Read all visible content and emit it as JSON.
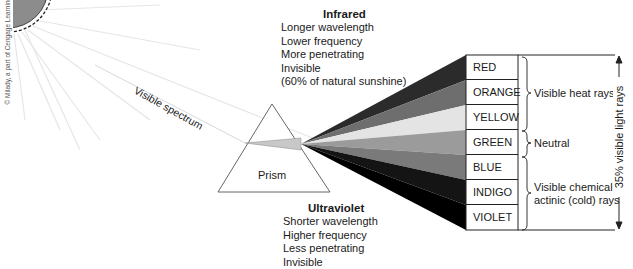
{
  "copyright": "© Milady, a part of Cengage Learning",
  "labels": {
    "visible_spectrum": "Visible spectrum",
    "prism": "Prism"
  },
  "infrared": {
    "title": "Infrared",
    "lines": [
      "Longer wavelength",
      "Lower frequency",
      "More penetrating",
      "Invisible",
      "(60% of natural sunshine)"
    ]
  },
  "ultraviolet": {
    "title": "Ultraviolet",
    "lines": [
      "Shorter wavelength",
      "Higher frequency",
      "Less penetrating",
      "Invisible"
    ]
  },
  "spectrum": {
    "colors": [
      {
        "label": "RED",
        "shade": "#2b2b2b"
      },
      {
        "label": "ORANGE",
        "shade": "#6e6e6e"
      },
      {
        "label": "YELLOW",
        "shade": "#e4e4e4"
      },
      {
        "label": "GREEN",
        "shade": "#9b9b9b"
      },
      {
        "label": "BLUE",
        "shade": "#7a7a7a"
      },
      {
        "label": "INDIGO",
        "shade": "#141414"
      },
      {
        "label": "VIOLET",
        "shade": "#000000"
      }
    ],
    "groups": [
      {
        "label_lines": [
          "Visible heat rays"
        ],
        "rows": "RED–YELLOW"
      },
      {
        "label_lines": [
          "Neutral"
        ],
        "rows": "GREEN"
      },
      {
        "label_lines": [
          "Visible chemical",
          "actinic (cold) rays"
        ],
        "rows": "BLUE–VIOLET"
      }
    ],
    "side_label": "35% visible light rays"
  }
}
